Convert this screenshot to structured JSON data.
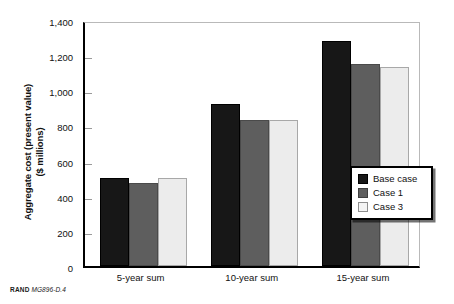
{
  "chart_data": {
    "type": "bar",
    "title": "",
    "xlabel": "",
    "ylabel": "Aggregate cost (present value)\n($ millions)",
    "ylabel_line1": "Aggregate cost (present value)",
    "ylabel_line2": "($ millions)",
    "categories": [
      "5-year sum",
      "10-year sum",
      "15-year sum"
    ],
    "series": [
      {
        "name": "Base case",
        "color": "#171717",
        "values": [
          500,
          920,
          1280
        ]
      },
      {
        "name": "Case 1",
        "color": "#5e5e5e",
        "values": [
          470,
          830,
          1150
        ]
      },
      {
        "name": "Case 3",
        "color": "#ececec",
        "values": [
          500,
          830,
          1130
        ]
      }
    ],
    "ylim": [
      0,
      1400
    ],
    "ytick_step": 200,
    "ytick_labels": [
      "1,400",
      "1,200",
      "1,000",
      "800",
      "600",
      "400",
      "200",
      "0"
    ],
    "ytick_values": [
      1400,
      1200,
      1000,
      800,
      600,
      400,
      200,
      0
    ],
    "grid": false,
    "legend_position": "inside-right"
  },
  "legend": {
    "items": [
      {
        "label": "Base case",
        "swatch": "base"
      },
      {
        "label": "Case 1",
        "swatch": "c1"
      },
      {
        "label": "Case 3",
        "swatch": "c3"
      }
    ]
  },
  "credit": {
    "brand": "RAND",
    "figure_id": "MG896-D.4"
  }
}
